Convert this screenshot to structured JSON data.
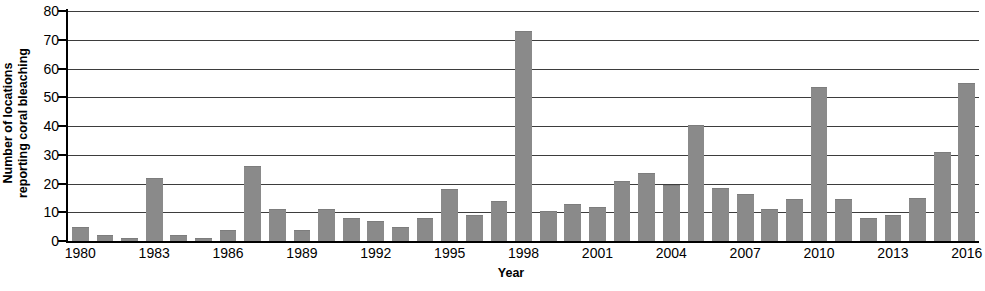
{
  "chart_data": {
    "type": "bar",
    "title": "",
    "xlabel": "Year",
    "ylabel": "Number of locations reporting coral bleaching",
    "ylabel_lines": [
      "Number of locations",
      "reporting coral bleaching"
    ],
    "ylim": [
      0,
      80
    ],
    "ytick_values": [
      0,
      10,
      20,
      30,
      40,
      50,
      60,
      70,
      80
    ],
    "ytick_labels": [
      "0",
      "10",
      "20",
      "30",
      "40",
      "50",
      "60",
      "70",
      "80"
    ],
    "grid": "horizontal",
    "legend": "none",
    "bar_color": "#8a8a8a",
    "axis_color": "#000000",
    "gridline_color": "#3d3d3d",
    "categories": [
      "1980",
      "1981",
      "1982",
      "1983",
      "1984",
      "1985",
      "1986",
      "1987",
      "1988",
      "1989",
      "1990",
      "1991",
      "1992",
      "1993",
      "1994",
      "1995",
      "1996",
      "1997",
      "1998",
      "1999",
      "2000",
      "2001",
      "2002",
      "2003",
      "2004",
      "2005",
      "2006",
      "2007",
      "2008",
      "2009",
      "2010",
      "2011",
      "2012",
      "2013",
      "2014",
      "2015",
      "2016"
    ],
    "values": [
      5,
      2,
      1,
      22,
      2,
      1,
      4,
      26,
      11,
      4,
      11,
      8,
      7,
      5,
      8,
      18,
      9,
      14,
      73,
      10.5,
      13,
      12,
      21,
      23.5,
      19.5,
      40.5,
      18.5,
      16.5,
      11,
      14.5,
      53.5,
      14.5,
      8,
      9,
      15,
      31,
      55
    ],
    "xtick_labels_shown": [
      "1980",
      "1983",
      "1986",
      "1989",
      "1992",
      "1995",
      "1998",
      "2001",
      "2004",
      "2007",
      "2010",
      "2013",
      "2016"
    ],
    "xtick_label_interval": 3
  }
}
